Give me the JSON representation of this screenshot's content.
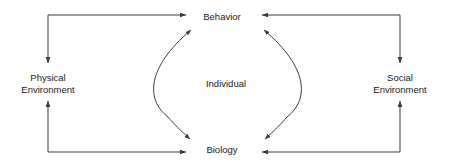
{
  "diagram": {
    "stroke_color": "#3a3a3a",
    "text_color": "#1a1a1a",
    "background_color": "#ffffff",
    "nodes": {
      "behavior": {
        "label": "Behavior"
      },
      "biology": {
        "label": "Biology"
      },
      "physical_environment": {
        "line1": "Physical",
        "line2": "Environment"
      },
      "social_environment": {
        "line1": "Social",
        "line2": "Environment"
      },
      "individual": {
        "label": "Individual"
      }
    },
    "connectors": [
      {
        "name": "physical-to-behavior",
        "from": "Physical Environment",
        "to": "Behavior",
        "style": "elbow",
        "arrow": "end"
      },
      {
        "name": "behavior-to-physical",
        "from": "Behavior",
        "to": "Physical Environment",
        "style": "elbow",
        "arrow": "end"
      },
      {
        "name": "social-to-behavior",
        "from": "Social Environment",
        "to": "Behavior",
        "style": "elbow",
        "arrow": "end"
      },
      {
        "name": "behavior-to-social",
        "from": "Behavior",
        "to": "Social Environment",
        "style": "elbow",
        "arrow": "end"
      },
      {
        "name": "physical-to-biology",
        "from": "Physical Environment",
        "to": "Biology",
        "style": "elbow",
        "arrow": "end"
      },
      {
        "name": "biology-to-physical",
        "from": "Biology",
        "to": "Physical Environment",
        "style": "elbow",
        "arrow": "end"
      },
      {
        "name": "social-to-biology",
        "from": "Social Environment",
        "to": "Biology",
        "style": "elbow",
        "arrow": "end"
      },
      {
        "name": "biology-to-social",
        "from": "Biology",
        "to": "Social Environment",
        "style": "elbow",
        "arrow": "end"
      },
      {
        "name": "left-curve-behavior-biology",
        "from": "Behavior",
        "to": "Biology",
        "style": "curve",
        "arrow": "both"
      },
      {
        "name": "right-curve-behavior-biology",
        "from": "Behavior",
        "to": "Biology",
        "style": "curve",
        "arrow": "both"
      }
    ]
  }
}
